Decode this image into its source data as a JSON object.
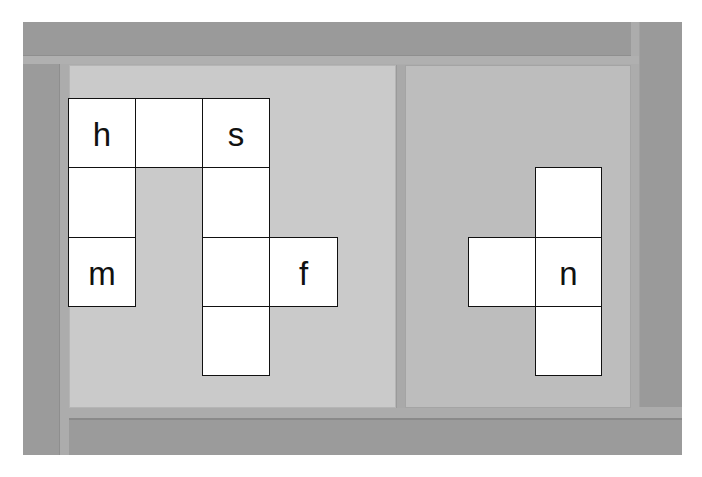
{
  "figure": {
    "colors": {
      "frame_dark": "#9a9a9a",
      "frame_light": "#b0b0b0",
      "panel_left": "#cacaca",
      "panel_right": "#bdbdbd",
      "cell_fill": "#ffffff",
      "cell_border": "#111111"
    },
    "left_panel": {
      "cells": [
        {
          "row": 0,
          "col": 0,
          "label": "h"
        },
        {
          "row": 0,
          "col": 1,
          "label": ""
        },
        {
          "row": 0,
          "col": 2,
          "label": "s"
        },
        {
          "row": 1,
          "col": 0,
          "label": ""
        },
        {
          "row": 1,
          "col": 2,
          "label": ""
        },
        {
          "row": 2,
          "col": 0,
          "label": "m"
        },
        {
          "row": 2,
          "col": 2,
          "label": ""
        },
        {
          "row": 2,
          "col": 3,
          "label": "f"
        },
        {
          "row": 3,
          "col": 2,
          "label": ""
        }
      ]
    },
    "right_panel": {
      "cells": [
        {
          "row": 0,
          "col": 1,
          "label": ""
        },
        {
          "row": 1,
          "col": 0,
          "label": ""
        },
        {
          "row": 1,
          "col": 1,
          "label": "n"
        },
        {
          "row": 2,
          "col": 1,
          "label": ""
        }
      ]
    }
  }
}
